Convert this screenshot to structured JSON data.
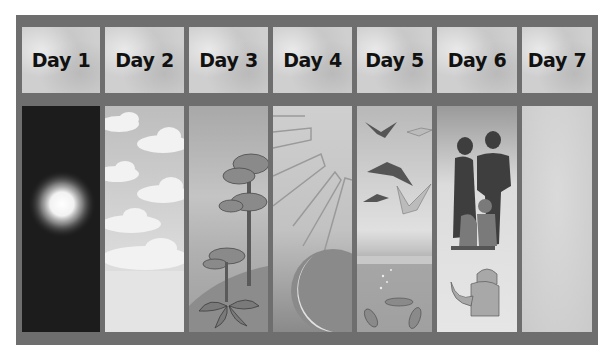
{
  "days": [
    {
      "label": "Day 1",
      "scene": "light in darkness"
    },
    {
      "label": "Day 2",
      "scene": "sky and clouds"
    },
    {
      "label": "Day 3",
      "scene": "land and plants"
    },
    {
      "label": "Day 4",
      "scene": "sun rays and moon"
    },
    {
      "label": "Day 5",
      "scene": "birds and fish"
    },
    {
      "label": "Day 6",
      "scene": "people and animals"
    },
    {
      "label": "Day 7",
      "scene": "rest (empty panel)"
    }
  ],
  "colors": {
    "frame": "#6e6e6e",
    "header_bg": "#cfcfcf",
    "label_text": "#111111",
    "day1_bg": "#1c1c1c"
  }
}
